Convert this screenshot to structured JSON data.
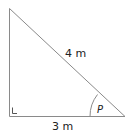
{
  "diagram": {
    "type": "right-triangle",
    "hypotenuse_label": "4 m",
    "base_label": "3 m",
    "angle_label": "P",
    "right_angle_marker": "L",
    "colors": {
      "stroke": "#8a8a8a",
      "text": "#222222",
      "background": "#ffffff"
    }
  }
}
